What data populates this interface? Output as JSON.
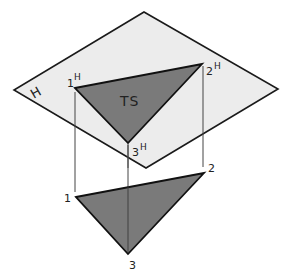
{
  "diagram": {
    "plane_label": "H",
    "true_size_label": "TS",
    "horizontal_view": {
      "points": [
        {
          "id": "1H",
          "num": "1",
          "sup": "H"
        },
        {
          "id": "2H",
          "num": "2",
          "sup": "H"
        },
        {
          "id": "3H",
          "num": "3",
          "sup": "H"
        }
      ]
    },
    "pictorial_view": {
      "points": [
        {
          "id": "1",
          "num": "1"
        },
        {
          "id": "2",
          "num": "2"
        },
        {
          "id": "3",
          "num": "3"
        }
      ]
    },
    "colors": {
      "plane_fill": "#ececec",
      "triangle_fill": "#7a7a7a",
      "outline": "#1a1a1a",
      "projector": "#444444"
    }
  }
}
